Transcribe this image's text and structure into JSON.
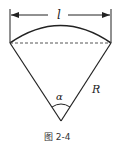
{
  "figure": {
    "caption": "图 2-4",
    "labels": {
      "arc_length": "l",
      "radius": "R",
      "angle": "α"
    },
    "colors": {
      "stroke": "#222222",
      "dashed": "#555555",
      "background": "#ffffff"
    }
  }
}
